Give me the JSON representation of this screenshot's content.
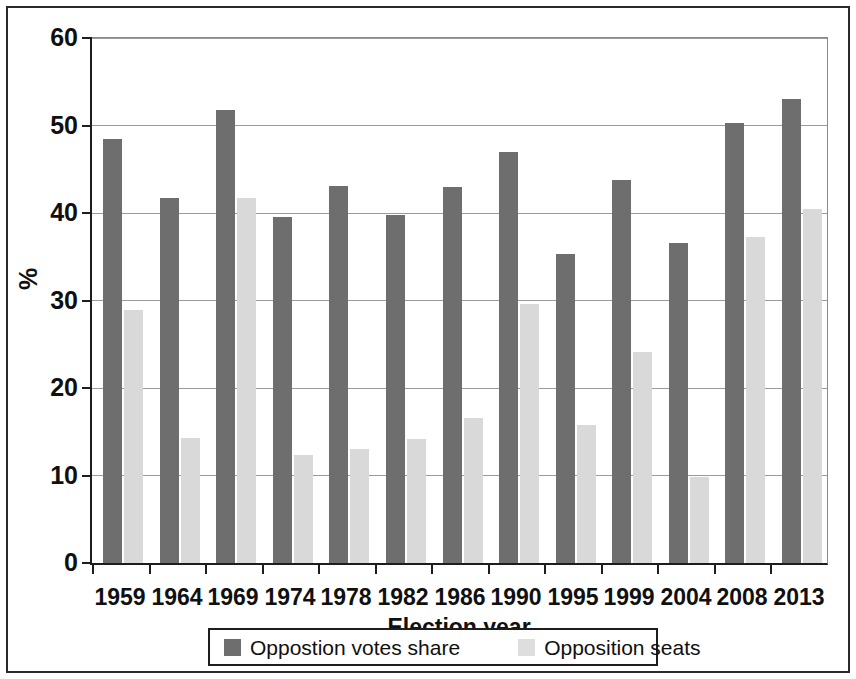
{
  "figure": {
    "background_color": "#ffffff",
    "frame_color": "#2a2a2a"
  },
  "chart_data": {
    "type": "bar",
    "title": "",
    "xlabel": "Election year",
    "ylabel": "%",
    "ylim": [
      0,
      60
    ],
    "yticks": [
      0,
      10,
      20,
      30,
      40,
      50,
      60
    ],
    "grid": true,
    "legend_position": "bottom",
    "categories": [
      "1959",
      "1964",
      "1969",
      "1974",
      "1978",
      "1982",
      "1986",
      "1990",
      "1995",
      "1999",
      "2004",
      "2008",
      "2013"
    ],
    "series": [
      {
        "name": "Oppostion votes share",
        "color": "#6e6e6e",
        "values": [
          48.4,
          41.7,
          51.8,
          39.5,
          43.1,
          39.8,
          43.0,
          47.0,
          35.3,
          43.8,
          36.6,
          50.3,
          53.0
        ]
      },
      {
        "name": "Opposition seats",
        "color": "#d9d9d9",
        "values": [
          28.9,
          14.3,
          41.7,
          12.3,
          13.0,
          14.2,
          16.6,
          29.6,
          15.8,
          24.1,
          9.8,
          37.3,
          40.5
        ]
      }
    ]
  },
  "axes": {
    "y_tick_labels": [
      "60",
      "50",
      "40",
      "30",
      "20",
      "10",
      "0"
    ],
    "y_title": "%",
    "x_title": "Election year"
  },
  "legend": {
    "entries": [
      {
        "label": "Oppostion votes share",
        "swatch": "dark-swatch-icon"
      },
      {
        "label": "Opposition seats",
        "swatch": "light-swatch-icon"
      }
    ]
  }
}
